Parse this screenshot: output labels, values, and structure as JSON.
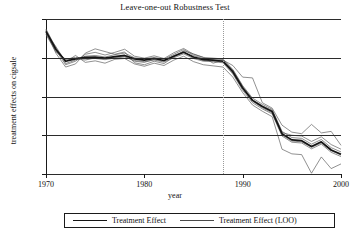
{
  "chart": {
    "title": "Leave-one-out Robustness Test",
    "xlabel": "year",
    "ylabel": "treatment effects on cigsale"
  },
  "legend": {
    "items": [
      {
        "label": "Treatment Effect",
        "style": "thick"
      },
      {
        "label": "Treatment Effect (LOO)",
        "style": "thin"
      }
    ]
  },
  "yticks": [
    "10",
    "0",
    "−10",
    "−20",
    "−30"
  ],
  "xticks": [
    "1970",
    "1980",
    "1990",
    "2000"
  ],
  "chart_data": {
    "type": "line",
    "title": "Leave-one-out Robustness Test",
    "xlabel": "year",
    "ylabel": "treatment effects on cigsale",
    "xlim": [
      1970,
      2000
    ],
    "ylim": [
      -30,
      10
    ],
    "yticks": [
      10,
      0,
      -10,
      -20,
      -30
    ],
    "xticks": [
      1970,
      1980,
      1990,
      2000
    ],
    "grid": "horizontal",
    "legend_position": "below-axes",
    "annotations": [
      {
        "type": "vline",
        "x": 1988,
        "style": "dotted",
        "label": "treatment year"
      }
    ],
    "x": [
      1970,
      1971,
      1972,
      1973,
      1974,
      1975,
      1976,
      1977,
      1978,
      1979,
      1980,
      1981,
      1982,
      1983,
      1984,
      1985,
      1986,
      1987,
      1988,
      1989,
      1990,
      1991,
      1992,
      1993,
      1994,
      1995,
      1996,
      1997,
      1998,
      1999,
      2000
    ],
    "series": [
      {
        "name": "Treatment Effect",
        "style": "thick",
        "values": [
          6.8,
          2.2,
          -0.9,
          -0.3,
          0.1,
          0.2,
          -0.1,
          0.3,
          0.6,
          -0.3,
          -0.6,
          -0.2,
          -0.7,
          0.4,
          1.4,
          0.2,
          -0.5,
          -0.6,
          -0.9,
          -3.6,
          -7.8,
          -11.0,
          -12.6,
          -13.9,
          -19.6,
          -21.2,
          -21.4,
          -22.9,
          -21.7,
          -23.8,
          -24.9
        ]
      },
      {
        "name": "Treatment Effect (LOO) 1",
        "style": "thin",
        "values": [
          7.4,
          2.6,
          -1.5,
          -0.6,
          0.4,
          0.6,
          0.2,
          0.8,
          1.2,
          0.0,
          -0.3,
          0.1,
          -0.4,
          0.9,
          2.1,
          0.6,
          -0.2,
          -0.3,
          -0.5,
          -3.0,
          -7.2,
          -10.4,
          -12.0,
          -13.3,
          -19.0,
          -20.6,
          -20.8,
          -22.3,
          -21.1,
          -23.2,
          -24.3
        ]
      },
      {
        "name": "Treatment Effect (LOO) 2",
        "style": "thin",
        "values": [
          6.2,
          1.8,
          -0.4,
          0.1,
          -0.3,
          -0.2,
          -0.5,
          -0.1,
          0.2,
          -0.7,
          -1.0,
          -0.6,
          -1.1,
          0.0,
          1.0,
          -0.2,
          -0.9,
          -1.0,
          -1.3,
          -4.2,
          -8.4,
          -11.6,
          -13.2,
          -14.5,
          -20.2,
          -21.8,
          -22.0,
          -23.5,
          -22.3,
          -24.4,
          -25.5
        ]
      },
      {
        "name": "Treatment Effect (LOO) 3",
        "style": "thin",
        "values": [
          7.0,
          1.2,
          -2.4,
          -1.6,
          1.2,
          2.3,
          1.6,
          0.9,
          1.5,
          -1.3,
          -1.8,
          -0.9,
          -1.5,
          0.2,
          1.8,
          1.0,
          0.1,
          -1.4,
          -0.6,
          -2.0,
          -5.0,
          -5.2,
          -11.6,
          -13.0,
          -17.4,
          -19.2,
          -19.6,
          -17.2,
          -19.4,
          -19.0,
          -22.6
        ]
      },
      {
        "name": "Treatment Effect (LOO) 4",
        "style": "thin",
        "values": [
          6.5,
          2.9,
          -1.1,
          0.6,
          -1.2,
          -0.8,
          -1.4,
          -0.4,
          -0.2,
          -1.6,
          -2.2,
          -1.4,
          -2.0,
          -0.6,
          0.4,
          -1.0,
          -1.8,
          -2.1,
          -2.4,
          -5.0,
          -9.0,
          -12.2,
          -13.8,
          -15.2,
          -23.6,
          -24.8,
          -25.0,
          -29.8,
          -25.6,
          -28.6,
          -27.4
        ]
      },
      {
        "name": "Treatment Effect (LOO) 5",
        "style": "thin",
        "values": [
          7.2,
          2.0,
          -1.8,
          -0.9,
          0.9,
          1.4,
          0.7,
          1.4,
          2.2,
          0.4,
          -0.1,
          0.5,
          -0.2,
          1.3,
          2.4,
          0.9,
          0.1,
          -0.1,
          -0.3,
          -3.2,
          -7.4,
          -10.8,
          -12.4,
          -13.6,
          -19.3,
          -20.0,
          -20.2,
          -21.6,
          -20.4,
          -22.4,
          -23.6
        ]
      },
      {
        "name": "Treatment Effect (LOO) 6",
        "style": "thin",
        "values": [
          6.0,
          1.5,
          -0.6,
          -0.2,
          -0.6,
          0.0,
          -0.3,
          0.1,
          0.4,
          -0.9,
          -1.2,
          -0.4,
          -0.9,
          0.6,
          1.6,
          0.0,
          -0.7,
          -0.8,
          -1.1,
          -3.9,
          -8.0,
          -11.2,
          -12.9,
          -14.2,
          -19.9,
          -21.5,
          -21.7,
          -23.1,
          -22.0,
          -24.0,
          -25.1
        ]
      }
    ]
  }
}
